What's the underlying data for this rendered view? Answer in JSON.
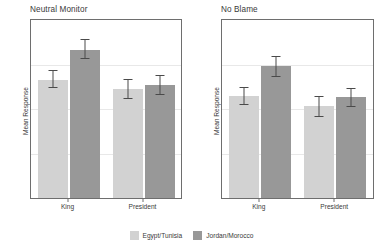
{
  "chart_data": {
    "type": "bar",
    "title": "",
    "categories": [
      "King",
      "President"
    ],
    "legend_position": "bottom",
    "grid": true,
    "panels": [
      {
        "title": "Neutral Monitor",
        "ylabel": "Mean Response",
        "xlabel": "",
        "ylim": [
          3,
          7
        ],
        "yticks": [
          3,
          4,
          5,
          6,
          7
        ],
        "ytick_labels": [
          "3",
          "4",
          "5",
          "6",
          "7"
        ],
        "xtick_labels": [
          "King",
          "President"
        ],
        "series": [
          {
            "name": "Egypt/Tunisia",
            "color": "#d2d2d2",
            "values": [
              5.65,
              5.45
            ],
            "err_low": [
              5.47,
              5.22
            ],
            "err_high": [
              5.88,
              5.67
            ]
          },
          {
            "name": "Jordan/Morocco",
            "color": "#989898",
            "values": [
              6.33,
              5.53
            ],
            "err_low": [
              6.12,
              5.32
            ],
            "err_high": [
              6.57,
              5.76
            ]
          }
        ]
      },
      {
        "title": "No Blame",
        "ylabel": "Mean Response",
        "xlabel": "",
        "ylim": [
          2,
          6
        ],
        "yticks": [
          2,
          3,
          4,
          5,
          6
        ],
        "ytick_labels": [
          "2",
          "3",
          "4",
          "5",
          "6"
        ],
        "xtick_labels": [
          "King",
          "President"
        ],
        "series": [
          {
            "name": "Egypt/Tunisia",
            "color": "#d2d2d2",
            "values": [
              4.3,
              4.07
            ],
            "err_low": [
              4.08,
              3.82
            ],
            "err_high": [
              4.5,
              4.3
            ]
          },
          {
            "name": "Jordan/Morocco",
            "color": "#989898",
            "values": [
              4.97,
              4.26
            ],
            "err_low": [
              4.73,
              4.05
            ],
            "err_high": [
              5.2,
              4.47
            ]
          }
        ]
      }
    ],
    "legend": [
      {
        "label": "Egypt/Tunisia",
        "color": "#d2d2d2"
      },
      {
        "label": "Jordan/Morocco",
        "color": "#989898"
      }
    ]
  }
}
